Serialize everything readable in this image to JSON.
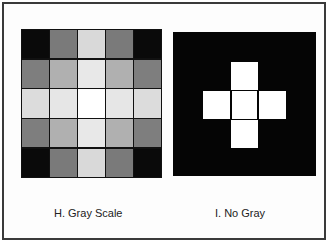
{
  "figures": [
    {
      "id": "H",
      "caption": "H.  Gray Scale",
      "grid_size": 5,
      "cells": [
        [
          "#0a0a0a",
          "#7a7a7a",
          "#d9d9d9",
          "#7a7a7a",
          "#0a0a0a"
        ],
        [
          "#7e7e7e",
          "#b0b0b0",
          "#e8e8e8",
          "#b0b0b0",
          "#7e7e7e"
        ],
        [
          "#dcdcdc",
          "#e6e6e6",
          "#ffffff",
          "#e6e6e6",
          "#dcdcdc"
        ],
        [
          "#7e7e7e",
          "#b0b0b0",
          "#e8e8e8",
          "#b0b0b0",
          "#7e7e7e"
        ],
        [
          "#0a0a0a",
          "#7a7a7a",
          "#d9d9d9",
          "#7a7a7a",
          "#0a0a0a"
        ]
      ]
    },
    {
      "id": "I",
      "caption": "I.  No Gray",
      "background": "#050505",
      "cross_color": "#ffffff"
    }
  ]
}
